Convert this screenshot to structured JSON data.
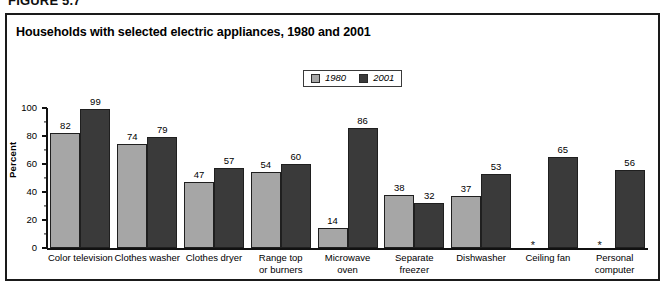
{
  "figure": {
    "number": "FIGURE 5.7",
    "title": "Households with selected electric appliances, 1980 and 2001"
  },
  "legend": {
    "items": [
      {
        "label": "1980",
        "color": "#a6a6a6"
      },
      {
        "label": "2001",
        "color": "#3a3a3a"
      }
    ]
  },
  "axis": {
    "ylabel": "Percent",
    "yticks": [
      "0",
      "20",
      "40",
      "60",
      "80",
      "100"
    ]
  },
  "notes": {
    "na_marker": "*"
  },
  "chart_data": {
    "type": "bar",
    "title": "Households with selected electric appliances, 1980 and 2001",
    "xlabel": "",
    "ylabel": "Percent",
    "ylim": [
      0,
      100
    ],
    "ytick_step": 20,
    "yminor_tick_step": 10,
    "grid": false,
    "legend_position": "top-center",
    "categories": [
      "Color television",
      "Clothes washer",
      "Clothes dryer",
      "Range top\nor burners",
      "Microwave\noven",
      "Separate\nfreezer",
      "Dishwasher",
      "Ceiling fan",
      "Personal\ncomputer"
    ],
    "series": [
      {
        "name": "1980",
        "color": "#a6a6a6",
        "values": [
          82,
          74,
          47,
          54,
          14,
          38,
          37,
          null,
          null
        ],
        "labels": [
          "82",
          "74",
          "47",
          "54",
          "14",
          "38",
          "37",
          "*",
          "*"
        ]
      },
      {
        "name": "2001",
        "color": "#3a3a3a",
        "values": [
          99,
          79,
          57,
          60,
          86,
          32,
          53,
          65,
          56
        ],
        "labels": [
          "99",
          "79",
          "57",
          "60",
          "86",
          "32",
          "53",
          "65",
          "56"
        ]
      }
    ]
  }
}
